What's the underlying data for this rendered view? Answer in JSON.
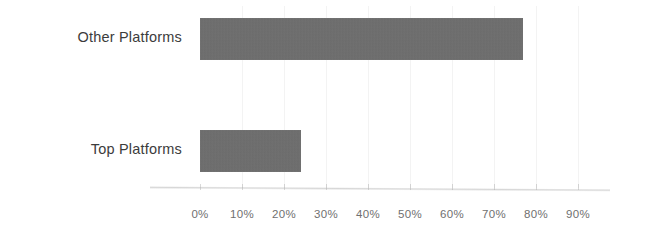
{
  "chart_data": {
    "type": "bar",
    "orientation": "horizontal",
    "title": "",
    "subtitle": "",
    "xlabel": "",
    "ylabel": "",
    "categories": [
      "Top Platforms",
      "Other Platforms"
    ],
    "values": [
      24,
      77
    ],
    "value_suffix": "%",
    "xlim": [
      0,
      90
    ],
    "xticks": [
      0,
      10,
      20,
      30,
      40,
      50,
      60,
      70,
      80,
      90
    ],
    "xtick_labels": [
      "0%",
      "10%",
      "20%",
      "30%",
      "40%",
      "50%",
      "60%",
      "70%",
      "80%",
      "90%"
    ],
    "grid": "faint-vertical",
    "legend": "none",
    "series": [
      {
        "name": "Share",
        "points": [
          {
            "category": "Other Platforms",
            "value": 77,
            "label": "77%"
          },
          {
            "category": "Top Platforms",
            "value": 24,
            "label": "24%"
          }
        ]
      }
    ],
    "colors": {
      "bar_fill": "#6e6e6e",
      "background": "#ffffff",
      "category_label_text": "#3c3c3c",
      "tick_label_text": "#707070",
      "axis_line": "#9a9a9a",
      "gridline": "#f3f3f3"
    }
  },
  "bars": [
    {
      "name": "other-platforms",
      "label": "Other Platforms",
      "value": 77,
      "value_label": "77%"
    },
    {
      "name": "top-platforms",
      "label": "Top Platforms",
      "value": 24,
      "value_label": "24%"
    }
  ],
  "axis": {
    "ticks": [
      {
        "value": 0,
        "label": "0%"
      },
      {
        "value": 10,
        "label": "10%"
      },
      {
        "value": 20,
        "label": "20%"
      },
      {
        "value": 30,
        "label": "30%"
      },
      {
        "value": 40,
        "label": "40%"
      },
      {
        "value": 50,
        "label": "50%"
      },
      {
        "value": 60,
        "label": "60%"
      },
      {
        "value": 70,
        "label": "70%"
      },
      {
        "value": 80,
        "label": "80%"
      },
      {
        "value": 90,
        "label": "90%"
      }
    ]
  }
}
